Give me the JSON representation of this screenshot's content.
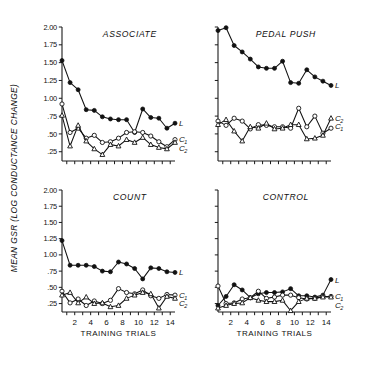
{
  "figure": {
    "y_axis_title": "MEAN GSR (LOG CONDUCTANCE CHANGE)",
    "x_axis_title": "TRAINING TRIALS",
    "series_labels": {
      "l": "L",
      "c1": "C",
      "c1_sub": "1",
      "c2": "C",
      "c2_sub": "2"
    },
    "ink_color": "#111111",
    "background": "#ffffff"
  },
  "chart_data": [
    {
      "type": "line",
      "title": "ASSOCIATE",
      "panel": "top-left",
      "xlabel": "TRAINING TRIALS",
      "ylabel": "MEAN GSR (LOG CONDUCTANCE CHANGE)",
      "x": [
        1,
        2,
        3,
        4,
        5,
        6,
        7,
        8,
        9,
        10,
        11,
        12,
        13,
        14
      ],
      "xlim": [
        0.4,
        14.6
      ],
      "ylim": [
        0.12,
        2.0
      ],
      "yticks": [
        "2.00",
        "1.75",
        "1.50",
        "1.25",
        "1.00",
        ".75",
        ".50",
        ".25"
      ],
      "ytickvals": [
        2.0,
        1.75,
        1.5,
        1.25,
        1.0,
        0.75,
        0.5,
        0.25
      ],
      "xticks": [
        "2",
        "4",
        "6",
        "8",
        "10",
        "12",
        "14"
      ],
      "xtickvals": [
        2,
        4,
        6,
        8,
        10,
        12,
        14
      ],
      "grid": false,
      "legend_position": "right-inline",
      "series": [
        {
          "name": "L",
          "marker": "filled-circle",
          "values": [
            1.53,
            1.22,
            1.12,
            0.84,
            0.83,
            0.74,
            0.71,
            0.7,
            0.7,
            0.52,
            0.85,
            0.73,
            0.72,
            0.58,
            0.65
          ]
        },
        {
          "name": "C1",
          "marker": "open-circle",
          "values": [
            0.92,
            0.52,
            0.58,
            0.44,
            0.48,
            0.38,
            0.39,
            0.44,
            0.52,
            0.53,
            0.52,
            0.47,
            0.39,
            0.32,
            0.42
          ]
        },
        {
          "name": "C2",
          "marker": "open-triangle",
          "values": [
            0.76,
            0.33,
            0.62,
            0.4,
            0.29,
            0.21,
            0.35,
            0.33,
            0.42,
            0.38,
            0.45,
            0.35,
            0.31,
            0.29,
            0.38
          ]
        }
      ]
    },
    {
      "type": "line",
      "title": "PEDAL PUSH",
      "panel": "top-right",
      "xlabel": "TRAINING TRIALS",
      "ylabel": "MEAN GSR (LOG CONDUCTANCE CHANGE)",
      "x": [
        1,
        2,
        3,
        4,
        5,
        6,
        7,
        8,
        9,
        10,
        11,
        12,
        13,
        14
      ],
      "xlim": [
        0.4,
        14.6
      ],
      "ylim": [
        0.12,
        2.0
      ],
      "yticks": [
        "2.00",
        "1.75",
        "1.50",
        "1.25",
        "1.00",
        ".75",
        ".50",
        ".25"
      ],
      "ytickvals": [
        2.0,
        1.75,
        1.5,
        1.25,
        1.0,
        0.75,
        0.5,
        0.25
      ],
      "xticks": [
        "2",
        "4",
        "6",
        "8",
        "10",
        "12",
        "14"
      ],
      "xtickvals": [
        2,
        4,
        6,
        8,
        10,
        12,
        14
      ],
      "grid": false,
      "legend_position": "right-inline",
      "series": [
        {
          "name": "L",
          "marker": "filled-circle",
          "values": [
            1.95,
            1.99,
            1.74,
            1.65,
            1.55,
            1.44,
            1.42,
            1.42,
            1.52,
            1.22,
            1.21,
            1.4,
            1.3,
            1.24,
            1.18
          ]
        },
        {
          "name": "C1",
          "marker": "open-circle",
          "values": [
            0.68,
            0.62,
            0.72,
            0.68,
            0.57,
            0.63,
            0.62,
            0.6,
            0.6,
            0.58,
            0.86,
            0.6,
            0.75,
            0.51,
            0.58
          ]
        },
        {
          "name": "C2",
          "marker": "open-triangle",
          "values": [
            0.63,
            0.7,
            0.54,
            0.4,
            0.6,
            0.58,
            0.65,
            0.57,
            0.58,
            0.63,
            0.63,
            0.43,
            0.44,
            0.48,
            0.72
          ]
        }
      ]
    },
    {
      "type": "line",
      "title": "COUNT",
      "panel": "bottom-left",
      "xlabel": "TRAINING TRIALS",
      "ylabel": "MEAN GSR (LOG CONDUCTANCE CHANGE)",
      "x": [
        1,
        2,
        3,
        4,
        5,
        6,
        7,
        8,
        9,
        10,
        11,
        12,
        13,
        14
      ],
      "xlim": [
        0.4,
        14.6
      ],
      "ylim": [
        0.12,
        2.0
      ],
      "yticks": [
        "2.00",
        "1.75",
        "1.50",
        "1.25",
        "1.00",
        ".75",
        ".50",
        ".25"
      ],
      "ytickvals": [
        2.0,
        1.75,
        1.5,
        1.25,
        1.0,
        0.75,
        0.5,
        0.25
      ],
      "xticks": [
        "2",
        "4",
        "6",
        "8",
        "10",
        "12",
        "14"
      ],
      "xtickvals": [
        2,
        4,
        6,
        8,
        10,
        12,
        14
      ],
      "grid": false,
      "legend_position": "right-inline",
      "series": [
        {
          "name": "L",
          "marker": "filled-circle",
          "values": [
            1.22,
            0.84,
            0.84,
            0.84,
            0.82,
            0.75,
            0.74,
            0.89,
            0.86,
            0.79,
            0.63,
            0.8,
            0.79,
            0.74,
            0.73
          ]
        },
        {
          "name": "C1",
          "marker": "open-circle",
          "values": [
            0.44,
            0.26,
            0.32,
            0.22,
            0.29,
            0.25,
            0.3,
            0.48,
            0.42,
            0.4,
            0.46,
            0.37,
            0.33,
            0.39,
            0.38
          ]
        },
        {
          "name": "C2",
          "marker": "open-triangle",
          "values": [
            0.38,
            0.42,
            0.26,
            0.35,
            0.25,
            0.26,
            0.2,
            0.22,
            0.33,
            0.38,
            0.42,
            0.4,
            0.18,
            0.36,
            0.33
          ]
        }
      ]
    },
    {
      "type": "line",
      "title": "CONTROL",
      "panel": "bottom-right",
      "xlabel": "TRAINING TRIALS",
      "ylabel": "MEAN GSR (LOG CONDUCTANCE CHANGE)",
      "x": [
        1,
        2,
        3,
        4,
        5,
        6,
        7,
        8,
        9,
        10,
        11,
        12,
        13,
        14
      ],
      "xlim": [
        0.4,
        14.6
      ],
      "ylim": [
        0.12,
        2.0
      ],
      "yticks": [
        "2.00",
        "1.75",
        "1.50",
        "1.25",
        "1.00",
        ".75",
        ".50",
        ".25"
      ],
      "ytickvals": [
        2.0,
        1.75,
        1.5,
        1.25,
        1.0,
        0.75,
        0.5,
        0.25
      ],
      "xticks": [
        "2",
        "4",
        "6",
        "8",
        "10",
        "12",
        "14"
      ],
      "xtickvals": [
        2,
        4,
        6,
        8,
        10,
        12,
        14
      ],
      "grid": false,
      "legend_position": "right-inline",
      "series": [
        {
          "name": "L",
          "marker": "filled-circle",
          "values": [
            0.22,
            0.36,
            0.54,
            0.46,
            0.34,
            0.4,
            0.42,
            0.42,
            0.43,
            0.48,
            0.37,
            0.37,
            0.35,
            0.38,
            0.62
          ]
        },
        {
          "name": "C1",
          "marker": "open-circle",
          "values": [
            0.52,
            0.25,
            0.26,
            0.32,
            0.34,
            0.44,
            0.33,
            0.35,
            0.38,
            0.38,
            0.34,
            0.32,
            0.33,
            0.36,
            0.36
          ]
        },
        {
          "name": "C2",
          "marker": "open-triangle",
          "values": [
            0.18,
            0.22,
            0.25,
            0.26,
            0.34,
            0.3,
            0.28,
            0.28,
            0.3,
            0.14,
            0.28,
            0.33,
            0.33,
            0.35,
            0.35
          ]
        }
      ]
    }
  ]
}
